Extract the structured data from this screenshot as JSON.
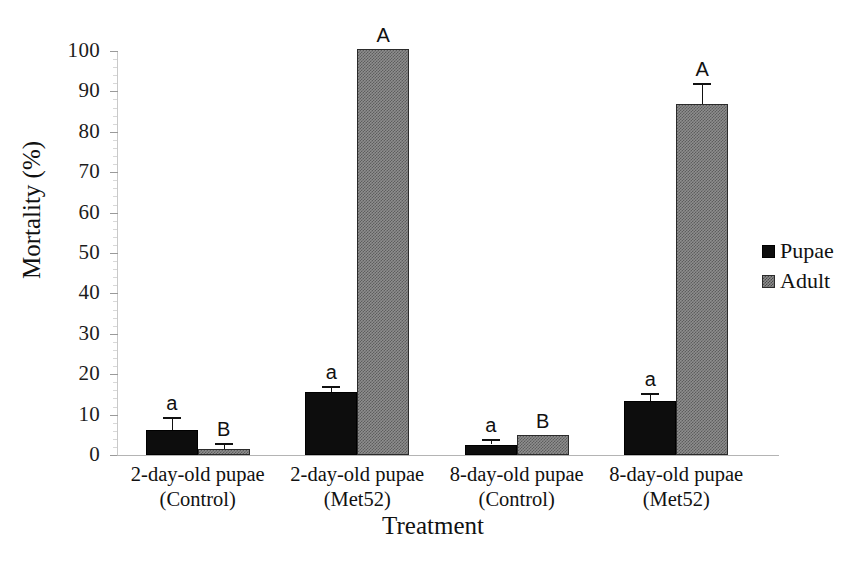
{
  "chart_data": {
    "type": "bar",
    "title": "",
    "xlabel": "Treatment",
    "ylabel": "Mortality (%)",
    "ylim": [
      0,
      100
    ],
    "ytick_step": 10,
    "yticks": [
      0,
      10,
      20,
      30,
      40,
      50,
      60,
      70,
      80,
      90,
      100
    ],
    "ytick_labels": [
      "0",
      "10",
      "20",
      "30",
      "40",
      "50",
      "60",
      "70",
      "80",
      "90",
      "100"
    ],
    "minor_tick_step": 2,
    "grid": false,
    "legend_position": "right",
    "categories": [
      "2-day-old pupae (Control)",
      "2-day-old pupae (Met52)",
      "8-day-old pupae (Control)",
      "8-day-old pupae (Met52)"
    ],
    "category_lines": [
      {
        "line1": "2-day-old pupae",
        "line2": "(Control)"
      },
      {
        "line1": "2-day-old pupae",
        "line2": "(Met52)"
      },
      {
        "line1": "8-day-old pupae",
        "line2": "(Control)"
      },
      {
        "line1": "8-day-old pupae",
        "line2": "(Met52)"
      }
    ],
    "series": [
      {
        "name": "Pupae",
        "color": "#0d0d0d",
        "fill": "solid-black",
        "values": [
          6.2,
          15.6,
          2.6,
          13.4
        ],
        "errors": [
          3.2,
          1.6,
          1.4,
          1.9
        ],
        "sig_letters": [
          "a",
          "a",
          "a",
          "a"
        ]
      },
      {
        "name": "Adult",
        "color": "#8e8e8e",
        "fill": "gray-checker",
        "values": [
          1.5,
          100.4,
          5.0,
          86.8
        ],
        "errors": [
          1.5,
          0.0,
          0.0,
          5.2
        ],
        "sig_letters": [
          "B",
          "A",
          "B",
          "A"
        ]
      }
    ]
  },
  "legend": {
    "items": [
      {
        "label": "Pupae",
        "swatch": "solid-black-square"
      },
      {
        "label": "Adult",
        "swatch": "gray-checker-square"
      }
    ]
  },
  "axes": {
    "y_title": "Mortality (%)",
    "x_title": "Treatment"
  }
}
